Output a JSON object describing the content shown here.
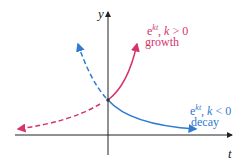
{
  "axes": {
    "x_label": "t",
    "y_label": "y"
  },
  "growth": {
    "base": "e",
    "exp": "kt",
    "cond_var": "k",
    "cond": " > 0",
    "label": "growth",
    "color": "#d6336c"
  },
  "decay": {
    "base": "e",
    "exp": "kt",
    "cond_var": "k",
    "cond": " < 0",
    "label": "decay",
    "color": "#2f7bd1"
  }
}
